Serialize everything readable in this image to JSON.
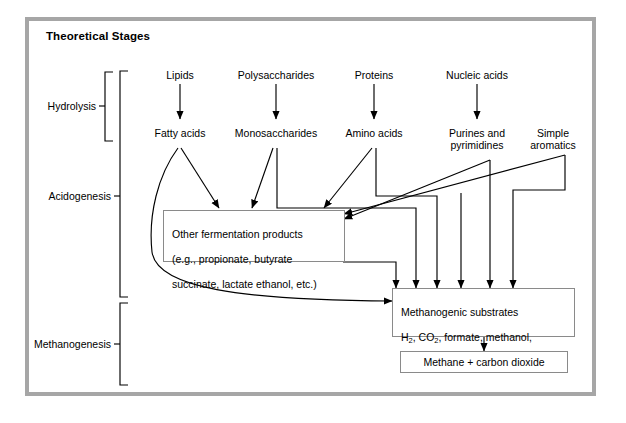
{
  "figure": {
    "title": "Theoretical Stages",
    "frame_color": "#a6a6a6",
    "line_color": "#000000",
    "background": "#ffffff"
  },
  "stages": [
    {
      "key": "hydrolysis",
      "label": "Hydrolysis"
    },
    {
      "key": "acidogenesis",
      "label": "Acidogenesis"
    },
    {
      "key": "methanogenesis",
      "label": "Methanogenesis"
    }
  ],
  "substrates": [
    {
      "key": "lipids",
      "label": "Lipids"
    },
    {
      "key": "polysaccharides",
      "label": "Polysaccharides"
    },
    {
      "key": "proteins",
      "label": "Proteins"
    },
    {
      "key": "nucleic-acids",
      "label": "Nucleic acids"
    }
  ],
  "monomers": [
    {
      "key": "fatty-acids",
      "label": "Fatty acids"
    },
    {
      "key": "monosaccharides",
      "label": "Monosaccharides"
    },
    {
      "key": "amino-acids",
      "label": "Amino acids"
    },
    {
      "key": "purines-pyrimidines",
      "label": "Purines and\npyrimidines"
    },
    {
      "key": "simple-aromatics",
      "label": "Simple\naromatics"
    }
  ],
  "boxes": {
    "fermentation": {
      "line1": "Other fermentation products",
      "line2": "(e.g., propionate, butyrate",
      "line3": "succinate, lactate ethanol, etc.)"
    },
    "methanogenic": {
      "line1": "Methanogenic substrates",
      "line2_a": "H",
      "line2_sub_a": "2",
      "line2_b": ", CO",
      "line2_sub_b": "2",
      "line2_c": ", formate, methanol,",
      "line3": "methylamines, acetate"
    },
    "methane": {
      "label": "Methane + carbon dioxide"
    }
  }
}
